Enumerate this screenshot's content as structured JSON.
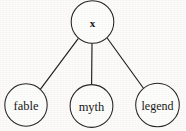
{
  "figure": {
    "type": "tree-diagram",
    "width": 186,
    "height": 131,
    "background_color": "#fcfbf9",
    "line_color": "#1f1e1d",
    "node_fill_color": "#fdfdfc",
    "node_stroke_color": "#262524"
  },
  "nodes": [
    {
      "id": "root",
      "label": "x",
      "cx": 92.5,
      "cy": 22,
      "r": 21.3,
      "role": "root"
    },
    {
      "id": "child-1",
      "label": "fable",
      "cx": 26,
      "cy": 105,
      "r": 21.2,
      "role": "leaf"
    },
    {
      "id": "child-2",
      "label": "myth",
      "cx": 91.5,
      "cy": 106,
      "r": 21.4,
      "role": "leaf"
    },
    {
      "id": "child-3",
      "label": "legend",
      "cx": 157.5,
      "cy": 105,
      "r": 21.8,
      "role": "leaf"
    }
  ],
  "edges": [
    {
      "id": "edge-root-fable",
      "from": "root",
      "to": "child-1",
      "x1": 78.0,
      "y1": 38.8,
      "x2": 40.5,
      "y2": 89.2
    },
    {
      "id": "edge-root-myth",
      "from": "root",
      "to": "child-2",
      "x1": 92.0,
      "y1": 43.3,
      "x2": 91.6,
      "y2": 84.6
    },
    {
      "id": "edge-root-legend",
      "from": "root",
      "to": "child-3",
      "x1": 107.5,
      "y1": 38.5,
      "x2": 144.0,
      "y2": 89.0
    }
  ]
}
